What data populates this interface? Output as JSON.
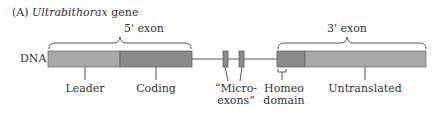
{
  "figure": {
    "panel_label": "(A)",
    "gene_name": "Ultrabithorax",
    "gene_suffix": "gene"
  },
  "row_label": "DNA",
  "exons": {
    "five_prime": "5' exon",
    "three_prime": "3' exon"
  },
  "segments": [
    {
      "id": "leader",
      "label": "Leader",
      "color": "#a9a9a9"
    },
    {
      "id": "coding",
      "label": "Coding",
      "color": "#8c8c8c"
    },
    {
      "id": "microexons",
      "label_line1": "“Micro-",
      "label_line2": "exons”",
      "color": "#8c8c8c"
    },
    {
      "id": "homeo",
      "label_line1": "Homeo",
      "label_line2": "domain",
      "color": "#8c8c8c"
    },
    {
      "id": "untranslated",
      "label": "Untranslated",
      "color": "#a9a9a9"
    }
  ]
}
